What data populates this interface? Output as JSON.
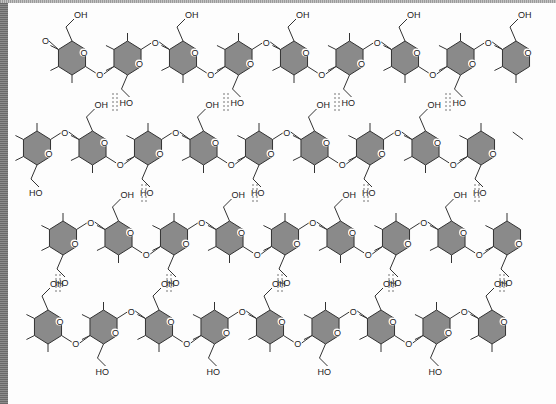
{
  "diagram": {
    "type": "cellulose-chain-hydrogen-bonding",
    "labels": {
      "ring_oxygen": "O",
      "glycosidic_oxygen": "O",
      "hydroxyl_up": "OH",
      "hydroxyl_down": "HO",
      "terminal_oxygen": "O"
    },
    "colors": {
      "ring_fill": "#8a8a8a",
      "stroke": "#333333",
      "hbond": "#777777",
      "background": "#fdfdfd"
    },
    "rows": [
      {
        "id": "chain-1",
        "y": 58,
        "start_x": 72,
        "count": 9,
        "first_orientation": "a"
      },
      {
        "id": "chain-2",
        "y": 148,
        "start_x": 37,
        "count": 9,
        "first_orientation": "b"
      },
      {
        "id": "chain-3",
        "y": 238,
        "start_x": 63,
        "count": 9,
        "first_orientation": "b"
      },
      {
        "id": "chain-4",
        "y": 327,
        "start_x": 48,
        "count": 9,
        "first_orientation": "a"
      }
    ],
    "spacing": 55.5,
    "hydrogen_bonds": [
      {
        "x": 115,
        "y1": 93,
        "y2": 113
      },
      {
        "x": 226,
        "y1": 93,
        "y2": 113
      },
      {
        "x": 337,
        "y1": 93,
        "y2": 113
      },
      {
        "x": 448,
        "y1": 93,
        "y2": 113
      },
      {
        "x": 144,
        "y1": 184,
        "y2": 204
      },
      {
        "x": 255,
        "y1": 184,
        "y2": 204
      },
      {
        "x": 366,
        "y1": 184,
        "y2": 204
      },
      {
        "x": 477,
        "y1": 184,
        "y2": 204
      },
      {
        "x": 58,
        "y1": 274,
        "y2": 294
      },
      {
        "x": 169,
        "y1": 274,
        "y2": 294
      },
      {
        "x": 280,
        "y1": 274,
        "y2": 294
      },
      {
        "x": 391,
        "y1": 274,
        "y2": 294
      },
      {
        "x": 502,
        "y1": 274,
        "y2": 294
      }
    ]
  }
}
